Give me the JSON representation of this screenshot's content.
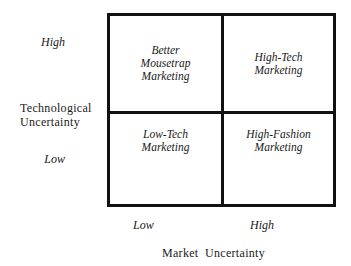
{
  "diagram": {
    "type": "2x2-matrix",
    "y_axis": {
      "title_line1": "Technological",
      "title_line2": "Uncertainty",
      "high_label": "High",
      "low_label": "Low"
    },
    "x_axis": {
      "title": "Market  Uncertainty",
      "low_label": "Low",
      "high_label": "High"
    },
    "quadrants": {
      "top_left": {
        "line1": "Better",
        "line2": "Mousetrap",
        "line3": "Marketing"
      },
      "top_right": {
        "line1": "High-Tech",
        "line2": "Marketing"
      },
      "bottom_left": {
        "line1": "Low-Tech",
        "line2": "Marketing"
      },
      "bottom_right": {
        "line1": "High-Fashion",
        "line2": "Marketing"
      }
    }
  }
}
